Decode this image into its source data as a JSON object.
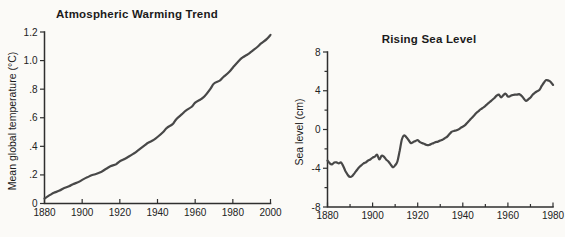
{
  "figure": {
    "background": "#fbfaf7",
    "line_color": "#484848",
    "axis_color": "#2f2f2f",
    "text_color": "#1b1b1b"
  },
  "chart_data": [
    {
      "type": "line",
      "title": "Atmospheric Warming Trend",
      "ylabel": "Mean global temperature (°C)",
      "xlabel": "",
      "xlim": [
        1880,
        2000
      ],
      "ylim": [
        0,
        1.2
      ],
      "grid": false,
      "legend": null,
      "xticks": {
        "values": [
          1880,
          1900,
          1920,
          1940,
          1960,
          1980,
          2000
        ],
        "labels": [
          "1880",
          "1900",
          "1920",
          "1940",
          "1960",
          "1980",
          "2000"
        ]
      },
      "yticks": {
        "values": [
          0,
          0.2,
          0.4,
          0.6,
          0.8,
          1.0,
          1.2
        ],
        "labels": [
          "0",
          ".2",
          ".4",
          ".6",
          ".8",
          "1.0",
          "1.2"
        ]
      },
      "minor_xticks": [],
      "minor_yticks": [],
      "points": [
        [
          1880,
          0.035
        ],
        [
          1883,
          0.06
        ],
        [
          1885,
          0.075
        ],
        [
          1888,
          0.09
        ],
        [
          1890,
          0.105
        ],
        [
          1893,
          0.12
        ],
        [
          1895,
          0.135
        ],
        [
          1898,
          0.15
        ],
        [
          1900,
          0.165
        ],
        [
          1903,
          0.185
        ],
        [
          1905,
          0.197
        ],
        [
          1907,
          0.205
        ],
        [
          1910,
          0.22
        ],
        [
          1913,
          0.245
        ],
        [
          1915,
          0.26
        ],
        [
          1918,
          0.275
        ],
        [
          1920,
          0.295
        ],
        [
          1923,
          0.315
        ],
        [
          1925,
          0.33
        ],
        [
          1928,
          0.355
        ],
        [
          1930,
          0.375
        ],
        [
          1933,
          0.405
        ],
        [
          1935,
          0.425
        ],
        [
          1938,
          0.445
        ],
        [
          1940,
          0.465
        ],
        [
          1943,
          0.5
        ],
        [
          1945,
          0.53
        ],
        [
          1948,
          0.555
        ],
        [
          1950,
          0.59
        ],
        [
          1953,
          0.625
        ],
        [
          1955,
          0.65
        ],
        [
          1958,
          0.675
        ],
        [
          1960,
          0.705
        ],
        [
          1963,
          0.73
        ],
        [
          1965,
          0.75
        ],
        [
          1968,
          0.8
        ],
        [
          1970,
          0.84
        ],
        [
          1973,
          0.86
        ],
        [
          1975,
          0.885
        ],
        [
          1978,
          0.92
        ],
        [
          1980,
          0.95
        ],
        [
          1983,
          0.995
        ],
        [
          1985,
          1.02
        ],
        [
          1988,
          1.045
        ],
        [
          1990,
          1.065
        ],
        [
          1993,
          1.095
        ],
        [
          1995,
          1.12
        ],
        [
          1998,
          1.15
        ],
        [
          2000,
          1.18
        ]
      ]
    },
    {
      "type": "line",
      "title": "Rising Sea Level",
      "ylabel": "Sea level (cm)",
      "xlabel": "",
      "xlim": [
        1880,
        1980
      ],
      "ylim": [
        -8,
        8
      ],
      "grid": false,
      "legend": null,
      "xticks": {
        "values": [
          1880,
          1900,
          1920,
          1940,
          1960,
          1980
        ],
        "labels": [
          "1880",
          "1900",
          "1920",
          "1940",
          "1960",
          "1980"
        ]
      },
      "yticks": {
        "values": [
          -8,
          -4,
          0,
          4,
          8
        ],
        "labels": [
          "-8",
          "-4",
          "0",
          "4",
          "8"
        ]
      },
      "minor_xticks": [
        1890,
        1910,
        1930,
        1950,
        1970
      ],
      "minor_yticks": [
        -6,
        -2,
        2,
        6
      ],
      "points": [
        [
          1880,
          -3.2
        ],
        [
          1881,
          -3.5
        ],
        [
          1882,
          -3.6
        ],
        [
          1883,
          -3.4
        ],
        [
          1884,
          -3.4
        ],
        [
          1885,
          -3.5
        ],
        [
          1886,
          -3.4
        ],
        [
          1887,
          -3.8
        ],
        [
          1888,
          -4.3
        ],
        [
          1889,
          -4.7
        ],
        [
          1890,
          -4.9
        ],
        [
          1891,
          -4.8
        ],
        [
          1892,
          -4.5
        ],
        [
          1893,
          -4.2
        ],
        [
          1894,
          -3.9
        ],
        [
          1895,
          -3.7
        ],
        [
          1896,
          -3.5
        ],
        [
          1897,
          -3.4
        ],
        [
          1898,
          -3.2
        ],
        [
          1899,
          -3.1
        ],
        [
          1900,
          -2.9
        ],
        [
          1901,
          -2.8
        ],
        [
          1902,
          -2.6
        ],
        [
          1903,
          -3.1
        ],
        [
          1904,
          -2.7
        ],
        [
          1905,
          -2.8
        ],
        [
          1906,
          -3.1
        ],
        [
          1907,
          -3.3
        ],
        [
          1908,
          -3.6
        ],
        [
          1909,
          -3.9
        ],
        [
          1910,
          -3.7
        ],
        [
          1911,
          -3.3
        ],
        [
          1912,
          -2.2
        ],
        [
          1913,
          -1.0
        ],
        [
          1914,
          -0.6
        ],
        [
          1915,
          -0.8
        ],
        [
          1916,
          -1.1
        ],
        [
          1917,
          -1.4
        ],
        [
          1918,
          -1.3
        ],
        [
          1919,
          -1.2
        ],
        [
          1920,
          -1.1
        ],
        [
          1921,
          -1.3
        ],
        [
          1922,
          -1.4
        ],
        [
          1923,
          -1.5
        ],
        [
          1924,
          -1.6
        ],
        [
          1925,
          -1.6
        ],
        [
          1926,
          -1.5
        ],
        [
          1927,
          -1.4
        ],
        [
          1928,
          -1.3
        ],
        [
          1929,
          -1.25
        ],
        [
          1930,
          -1.15
        ],
        [
          1931,
          -1.05
        ],
        [
          1932,
          -0.9
        ],
        [
          1933,
          -0.75
        ],
        [
          1934,
          -0.5
        ],
        [
          1935,
          -0.25
        ],
        [
          1936,
          -0.15
        ],
        [
          1937,
          -0.1
        ],
        [
          1938,
          0.0
        ],
        [
          1939,
          0.15
        ],
        [
          1940,
          0.3
        ],
        [
          1941,
          0.45
        ],
        [
          1942,
          0.7
        ],
        [
          1943,
          0.95
        ],
        [
          1944,
          1.2
        ],
        [
          1945,
          1.45
        ],
        [
          1946,
          1.7
        ],
        [
          1947,
          1.9
        ],
        [
          1948,
          2.1
        ],
        [
          1949,
          2.25
        ],
        [
          1950,
          2.45
        ],
        [
          1951,
          2.65
        ],
        [
          1952,
          2.85
        ],
        [
          1953,
          3.05
        ],
        [
          1954,
          3.25
        ],
        [
          1955,
          3.5
        ],
        [
          1956,
          3.6
        ],
        [
          1957,
          3.3
        ],
        [
          1958,
          3.55
        ],
        [
          1959,
          3.7
        ],
        [
          1960,
          3.4
        ],
        [
          1961,
          3.45
        ],
        [
          1962,
          3.55
        ],
        [
          1963,
          3.6
        ],
        [
          1964,
          3.6
        ],
        [
          1965,
          3.65
        ],
        [
          1966,
          3.5
        ],
        [
          1967,
          3.2
        ],
        [
          1968,
          2.95
        ],
        [
          1969,
          3.1
        ],
        [
          1970,
          3.3
        ],
        [
          1971,
          3.6
        ],
        [
          1972,
          3.8
        ],
        [
          1973,
          3.95
        ],
        [
          1974,
          4.1
        ],
        [
          1975,
          4.5
        ],
        [
          1976,
          4.85
        ],
        [
          1977,
          5.1
        ],
        [
          1978,
          5.05
        ],
        [
          1979,
          4.9
        ],
        [
          1980,
          4.6
        ]
      ]
    }
  ]
}
